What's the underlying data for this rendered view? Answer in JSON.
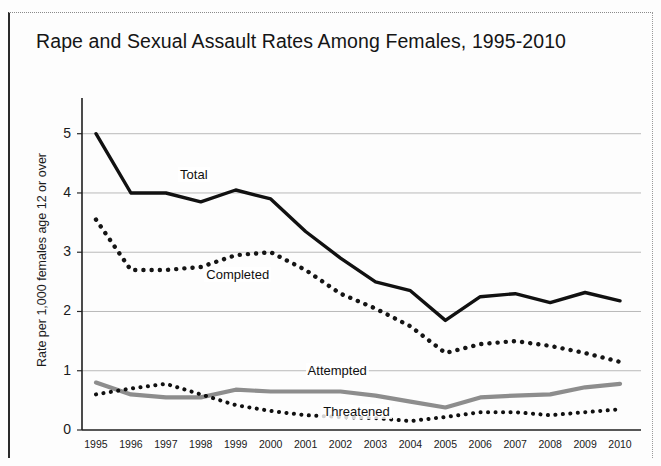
{
  "chart_data": {
    "type": "line",
    "title": "Rape and Sexual Assault Rates Among Females, 1995-2010",
    "xlabel": "",
    "ylabel": "Rate per 1,000 females age 12 or over",
    "xlim": [
      1994.6,
      2010.6
    ],
    "ylim": [
      0,
      5.4
    ],
    "grid": "horizontal",
    "legend_position": "inline-labels",
    "x": [
      1995,
      1996,
      1997,
      1998,
      1999,
      2000,
      2001,
      2002,
      2003,
      2004,
      2005,
      2006,
      2007,
      2008,
      2009,
      2010
    ],
    "categories": [
      "1995",
      "1996",
      "1997",
      "1998",
      "1999",
      "2000",
      "2001",
      "2002",
      "2003",
      "2004",
      "2005",
      "2006",
      "2007",
      "2008",
      "2009",
      "2010"
    ],
    "yticks": [
      0,
      1,
      2,
      3,
      4,
      5
    ],
    "ytick_labels": [
      "0",
      "1",
      "2",
      "3",
      "4",
      "5"
    ],
    "series": [
      {
        "name": "Total",
        "style": "solid",
        "color": "#111111",
        "width": 3.4,
        "label_x": 1997.35,
        "label_y": 4.28,
        "values": [
          5.0,
          4.0,
          4.0,
          3.85,
          4.05,
          3.9,
          3.35,
          2.9,
          2.5,
          2.35,
          1.85,
          2.25,
          2.3,
          2.15,
          2.32,
          2.18
        ]
      },
      {
        "name": "Completed",
        "style": "dotted",
        "color": "#151515",
        "width": 4.4,
        "label_x": 1998.1,
        "label_y": 2.6,
        "values": [
          3.55,
          2.7,
          2.7,
          2.75,
          2.95,
          3.0,
          2.7,
          2.3,
          2.05,
          1.75,
          1.3,
          1.45,
          1.5,
          1.42,
          1.3,
          1.15
        ]
      },
      {
        "name": "Attempted",
        "style": "solid",
        "color": "#8d8d8d",
        "width": 4.2,
        "label_x": 2001.0,
        "label_y": 0.98,
        "values": [
          0.8,
          0.6,
          0.55,
          0.55,
          0.68,
          0.65,
          0.65,
          0.65,
          0.58,
          0.48,
          0.38,
          0.55,
          0.58,
          0.6,
          0.72,
          0.78
        ]
      },
      {
        "name": "Threatened",
        "style": "dotted",
        "color": "#101010",
        "width": 4.0,
        "label_x": 2001.45,
        "label_y": 0.28,
        "values": [
          0.6,
          0.7,
          0.78,
          0.6,
          0.42,
          0.32,
          0.25,
          0.22,
          0.2,
          0.15,
          0.22,
          0.3,
          0.3,
          0.25,
          0.3,
          0.35
        ]
      }
    ]
  },
  "plot": {
    "left": 82,
    "right": 641,
    "top": 110,
    "bottom": 430
  }
}
